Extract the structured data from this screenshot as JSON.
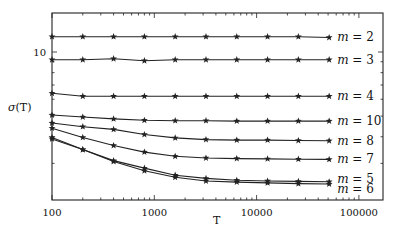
{
  "chart_data": {
    "type": "line",
    "title": "",
    "xlabel": "T",
    "ylabel": "σ(T)",
    "xscale": "log",
    "yscale": "log",
    "xlim": [
      100,
      180000
    ],
    "ylim": [
      2.02,
      15.2
    ],
    "x_ticks": [
      100,
      1000,
      10000,
      100000
    ],
    "x_tick_labels": [
      "100",
      "1000",
      "10000",
      "100000"
    ],
    "y_ticks": [
      10
    ],
    "y_tick_labels": [
      "10"
    ],
    "grid": false,
    "legend": "inline labels at right end of each series",
    "marker": "star",
    "x": [
      100,
      200,
      400,
      800,
      1600,
      3200,
      6400,
      12800,
      25600,
      51200
    ],
    "series": [
      {
        "name": "m = 2",
        "values": [
          11.8,
          11.8,
          11.8,
          11.8,
          11.8,
          11.8,
          11.8,
          11.8,
          11.8,
          11.7
        ]
      },
      {
        "name": "m = 3",
        "values": [
          9.2,
          9.2,
          9.3,
          9.1,
          9.2,
          9.2,
          9.2,
          9.2,
          9.2,
          9.2
        ]
      },
      {
        "name": "m = 4",
        "values": [
          6.4,
          6.2,
          6.2,
          6.2,
          6.2,
          6.2,
          6.2,
          6.2,
          6.2,
          6.2
        ]
      },
      {
        "name": "m = 10",
        "values": [
          5.06,
          4.95,
          4.85,
          4.78,
          4.76,
          4.76,
          4.74,
          4.74,
          4.74,
          4.74
        ]
      },
      {
        "name": "m = 8",
        "values": [
          4.64,
          4.46,
          4.33,
          4.1,
          3.95,
          3.88,
          3.86,
          3.86,
          3.84,
          3.83
        ]
      },
      {
        "name": "m = 7",
        "values": [
          4.39,
          3.97,
          3.64,
          3.39,
          3.24,
          3.18,
          3.16,
          3.15,
          3.14,
          3.13
        ]
      },
      {
        "name": "m = 5",
        "values": [
          3.97,
          3.48,
          3.09,
          2.85,
          2.64,
          2.55,
          2.5,
          2.48,
          2.47,
          2.46
        ]
      },
      {
        "name": "m = 6",
        "values": [
          3.91,
          3.48,
          3.06,
          2.77,
          2.58,
          2.48,
          2.45,
          2.43,
          2.41,
          2.4
        ]
      }
    ]
  },
  "labels": {
    "ylabel_main": "σ",
    "ylabel_arg": "(T)",
    "xlabel": "T",
    "series_labels": [
      {
        "m": "m",
        "eq": " = 2"
      },
      {
        "m": "m",
        "eq": " = 3"
      },
      {
        "m": "m",
        "eq": " = 4"
      },
      {
        "m": "m",
        "eq": " = 10"
      },
      {
        "m": "m",
        "eq": " = 8"
      },
      {
        "m": "m",
        "eq": " = 7"
      },
      {
        "m": "m",
        "eq": " = 5"
      },
      {
        "m": "m",
        "eq": " = 6"
      }
    ]
  }
}
